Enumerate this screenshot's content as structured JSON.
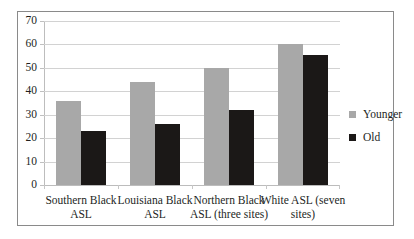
{
  "chart_data": {
    "type": "bar",
    "title": "",
    "xlabel": "",
    "ylabel": "",
    "ylim": [
      0,
      70
    ],
    "ytick_step": 10,
    "yticks": [
      "0",
      "10",
      "20",
      "30",
      "40",
      "50",
      "60",
      "70"
    ],
    "grid": true,
    "legend_position": "right",
    "categories": [
      "Southern Black ASL",
      "Louisiana Black ASL",
      "Northern Black ASL (three sites)",
      "White ASL (seven sites)"
    ],
    "series": [
      {
        "name": "Younger",
        "color": "#a8a8a8",
        "values": [
          36,
          44,
          50,
          60
        ]
      },
      {
        "name": "Old",
        "color": "#1b1817",
        "values": [
          23,
          26,
          32,
          55.5
        ]
      }
    ]
  },
  "legend": {
    "items": [
      {
        "label": "Younger",
        "swatch": "legend-swatch-younger"
      },
      {
        "label": "Old",
        "swatch": "legend-swatch-old"
      }
    ]
  },
  "colors": {
    "younger": "#a8a8a8",
    "old": "#1b1817",
    "gridline": "#d2d2d2",
    "axis": "#bdbdbd",
    "border": "#8a8a8a",
    "text": "#231f1e",
    "background": "#ffffff"
  }
}
